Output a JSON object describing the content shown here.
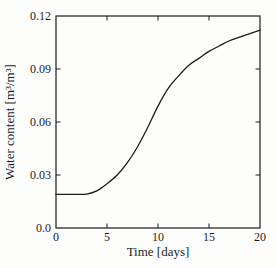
{
  "figure": {
    "background": "#fdfdfc",
    "axis_color": "#1c1c1c",
    "curve_color": "#1c1c1c"
  },
  "chart_data": {
    "type": "line",
    "title": "",
    "xlabel": "Time [days]",
    "ylabel": "Water content [m³/m³]",
    "xlim": [
      0,
      20
    ],
    "ylim": [
      0,
      0.12
    ],
    "xticks": [
      0,
      5,
      10,
      15,
      20
    ],
    "xtick_labels": [
      "0",
      "5",
      "10",
      "15",
      "20"
    ],
    "yticks": [
      0,
      0.03,
      0.06,
      0.09,
      0.12
    ],
    "ytick_labels": [
      "0.0",
      "0.03",
      "0.06",
      "0.09",
      "0.12"
    ],
    "grid": false,
    "legend": "none",
    "tick_style": "inward-all-sides",
    "series": [
      {
        "name": "water-content-curve",
        "x": [
          0,
          1,
          2,
          3,
          4,
          5,
          6,
          7,
          8,
          9,
          10,
          11,
          12,
          13,
          14,
          15,
          16,
          17,
          18,
          19,
          20
        ],
        "y": [
          0.019,
          0.019,
          0.019,
          0.0192,
          0.021,
          0.025,
          0.03,
          0.037,
          0.046,
          0.057,
          0.069,
          0.079,
          0.086,
          0.092,
          0.096,
          0.1,
          0.103,
          0.106,
          0.108,
          0.11,
          0.112
        ]
      }
    ]
  }
}
